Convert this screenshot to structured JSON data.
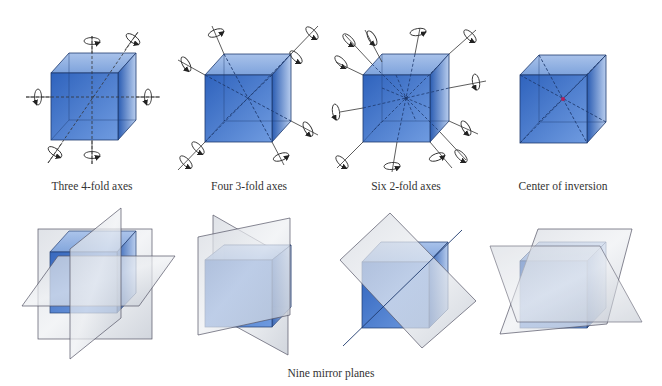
{
  "figure": {
    "panels": [
      {
        "id": "four-fold",
        "caption": "Three 4-fold axes",
        "axis_count": 3
      },
      {
        "id": "three-fold",
        "caption": "Four 3-fold axes",
        "axis_count": 4
      },
      {
        "id": "two-fold",
        "caption": "Six 2-fold axes",
        "axis_count": 6
      },
      {
        "id": "inversion",
        "caption": "Center of inversion"
      }
    ],
    "mirror_caption": "Nine mirror planes",
    "colors": {
      "cube_front": "#3d6fc4",
      "cube_side": "#2d5fb0",
      "cube_top": "#8fb0e0",
      "plane": "#c6ccd6",
      "line": "#1e3a6e",
      "axis": "#333333",
      "center_dot": "#b0205a"
    }
  }
}
